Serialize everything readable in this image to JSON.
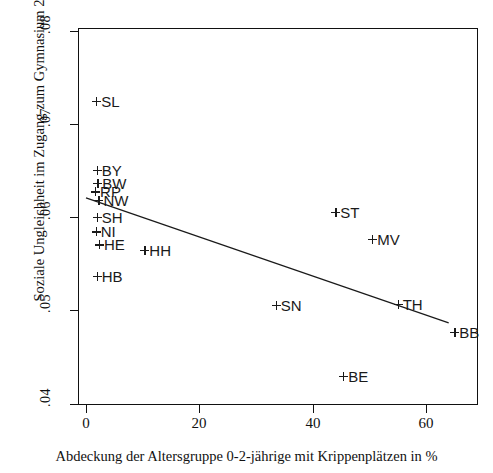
{
  "chart_data": {
    "type": "scatter",
    "title": "",
    "xlabel": "Abdeckung der Altersgruppe 0-2-jährige mit Krippenplätzen in %",
    "ylabel": "Soziale Ungleichheit im Zugang zum Gymnasium 2000",
    "xlim": [
      -1.5,
      69
    ],
    "ylim": [
      0.0395,
      0.0805
    ],
    "xticks": [
      0,
      20,
      40,
      60
    ],
    "xtick_labels": [
      "0",
      "20",
      "40",
      "60"
    ],
    "yticks": [
      0.04,
      0.05,
      0.06,
      0.07,
      0.08
    ],
    "ytick_labels": [
      ".04",
      ".05",
      ".06",
      ".07",
      ".08"
    ],
    "grid": false,
    "legend": "none",
    "marker": "plus",
    "point_color": "#1a1a1a",
    "line_color": "#1a1a1a",
    "points": [
      {
        "label": "SL",
        "x": 1.8,
        "y": 0.0724
      },
      {
        "label": "BY",
        "x": 1.9,
        "y": 0.065
      },
      {
        "label": "BW",
        "x": 2.0,
        "y": 0.0636
      },
      {
        "label": "RP",
        "x": 1.6,
        "y": 0.0627
      },
      {
        "label": "NW",
        "x": 2.2,
        "y": 0.0618
      },
      {
        "label": "SH",
        "x": 1.9,
        "y": 0.06
      },
      {
        "label": "NI",
        "x": 1.7,
        "y": 0.0584
      },
      {
        "label": "HE",
        "x": 2.3,
        "y": 0.057
      },
      {
        "label": "HH",
        "x": 10.3,
        "y": 0.0564
      },
      {
        "label": "HB",
        "x": 1.9,
        "y": 0.0536
      },
      {
        "label": "ST",
        "x": 44.0,
        "y": 0.0605
      },
      {
        "label": "MV",
        "x": 50.5,
        "y": 0.0576
      },
      {
        "label": "SN",
        "x": 33.5,
        "y": 0.0505
      },
      {
        "label": "TH",
        "x": 55.0,
        "y": 0.0506
      },
      {
        "label": "BB",
        "x": 65.0,
        "y": 0.0476
      },
      {
        "label": "BE",
        "x": 45.4,
        "y": 0.0429
      }
    ],
    "fit_line": {
      "kind": "linear-regression",
      "x_start": 0.0,
      "y_start": 0.0621,
      "x_end": 64.0,
      "y_end": 0.0487
    }
  }
}
